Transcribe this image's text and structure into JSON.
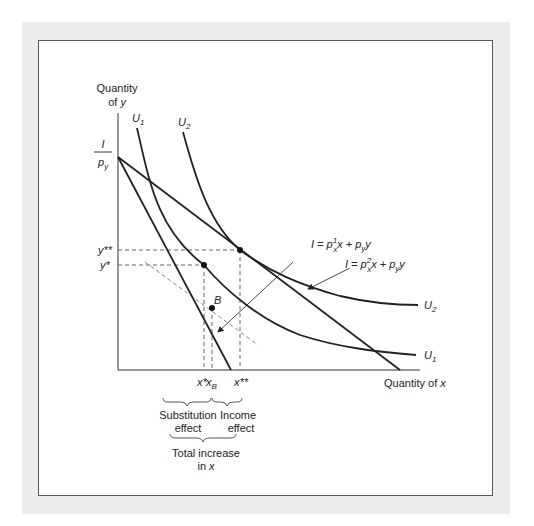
{
  "figure": {
    "y_axis_label_line1": "Quantity",
    "y_axis_label_line2": "of",
    "y_axis_label_var": "y",
    "x_axis_label": "Quantity of",
    "x_axis_label_var": "x",
    "intercept_numerator": "I",
    "intercept_denominator": "p",
    "intercept_denominator_sub": "y",
    "curves": {
      "u1_top": "U",
      "u1_top_sub": "1",
      "u2_top": "U",
      "u2_top_sub": "2",
      "u2_right": "U",
      "u2_right_sub": "2",
      "u1_right": "U",
      "u1_right_sub": "1"
    },
    "budget_line_1": {
      "I": "I",
      "eq": " = p",
      "sup": "1",
      "sub": "x",
      "rest1": "x + p",
      "sub2": "y",
      "rest2": "y"
    },
    "budget_line_2": {
      "I": "I",
      "eq": " = p",
      "sup": "2",
      "sub": "x",
      "rest1": "x + p",
      "sub2": "y",
      "rest2": "y"
    },
    "y_ticks": {
      "y_double_star": "y**",
      "y_star": "y*"
    },
    "x_ticks": {
      "x_star": "x*",
      "x_B": "x",
      "x_B_sub": "B",
      "x_double_star": "x**"
    },
    "point_B": "B",
    "annotations": {
      "substitution_line1": "Substitution",
      "substitution_line2": "effect",
      "income_line1": "Income",
      "income_line2": "effect",
      "total_line1": "Total increase",
      "total_line2": "in",
      "total_var": "x"
    },
    "colors": {
      "line": "#222222",
      "dash": "#555555",
      "frame": "#ececec"
    }
  }
}
